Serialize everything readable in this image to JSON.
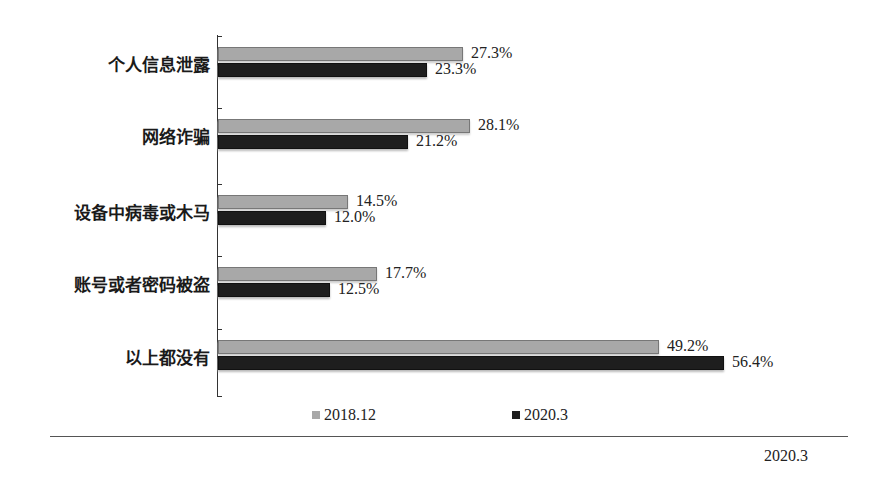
{
  "chart_data": {
    "type": "bar",
    "orientation": "horizontal",
    "title": "",
    "xlabel": "",
    "ylabel": "",
    "categories": [
      "个人信息泄露",
      "网络诈骗",
      "设备中病毒或木马",
      "账号或者密码被盗",
      "以上都没有"
    ],
    "series": [
      {
        "name": "2018.12",
        "color": "#a8a8a8",
        "values": [
          27.3,
          28.1,
          14.5,
          17.7,
          49.2
        ],
        "labels": [
          "27.3%",
          "28.1%",
          "14.5%",
          "17.7%",
          "49.2%"
        ]
      },
      {
        "name": "2020.3",
        "color": "#1e1e1e",
        "values": [
          23.3,
          21.2,
          12.0,
          12.5,
          56.4
        ],
        "labels": [
          "23.3%",
          "21.2%",
          "12.0%",
          "12.5%",
          "56.4%"
        ]
      }
    ],
    "unit": "%",
    "grid": false,
    "legend_position": "bottom"
  },
  "source_note": "2020.3"
}
